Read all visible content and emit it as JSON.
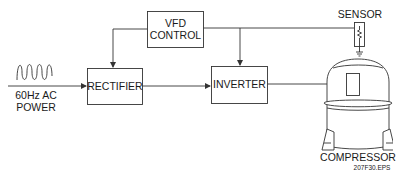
{
  "diagram": {
    "type": "block-diagram",
    "blocks": {
      "vfd_control": {
        "line1": "VFD",
        "line2": "CONTROL"
      },
      "rectifier": {
        "label": "RECTIFIER"
      },
      "inverter": {
        "label": "INVERTER"
      }
    },
    "input": {
      "line1": "60Hz AC",
      "line2": "POWER",
      "icon": "sine-wave-icon"
    },
    "sensor": {
      "label": "SENSOR",
      "icon": "thermistor-icon"
    },
    "compressor": {
      "label": "COMPRESSOR"
    },
    "figure_id": "207F30.EPS",
    "connections": [
      {
        "from": "60Hz AC POWER",
        "to": "RECTIFIER"
      },
      {
        "from": "RECTIFIER",
        "to": "INVERTER"
      },
      {
        "from": "INVERTER",
        "to": "COMPRESSOR"
      },
      {
        "from": "VFD CONTROL",
        "to": "RECTIFIER"
      },
      {
        "from": "VFD CONTROL",
        "to": "INVERTER"
      },
      {
        "from": "VFD CONTROL",
        "to": "SENSOR"
      }
    ],
    "colors": {
      "stroke": "#333333",
      "background": "#ffffff"
    }
  }
}
